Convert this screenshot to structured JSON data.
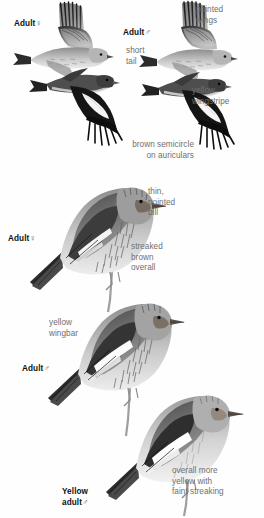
{
  "plate": {
    "species": "Pine Siskin",
    "background_color": "#ffffff",
    "label_color": "#111111",
    "annotation_color": "#6f6f6f"
  },
  "labels": {
    "flight_female": "Adult",
    "flight_female_sex": "♀",
    "flight_male": "Adult",
    "flight_male_sex": "♂",
    "perched_female": "Adult",
    "perched_female_sex": "♀",
    "perched_male": "Adult",
    "perched_male_sex": "♂",
    "yellow_adult": "Yellow\nadult",
    "yellow_adult_sex": "♂"
  },
  "annotations": {
    "pointed_wings": "pointed\nwings",
    "short_tail": "short\ntail",
    "yellow_wingstripe": "yellow\nwingstripe",
    "brown_semicircle": "brown semicircle\non auriculars",
    "thin_pointed_bill": "thin,\npointed\nbill",
    "streaked_brown": "streaked\nbrown\noverall",
    "yellow_wingbar": "yellow\nwingbar",
    "overall_more_yellow": "overall more\nyellow with\nfaint streaking"
  },
  "figures": [
    {
      "name": "flight-female-upper",
      "pose": "flight-upperside",
      "sex": "female"
    },
    {
      "name": "flight-female-lower",
      "pose": "flight-underside",
      "sex": "female"
    },
    {
      "name": "flight-male-upper",
      "pose": "flight-upperside",
      "sex": "male"
    },
    {
      "name": "flight-male-lower",
      "pose": "flight-underside",
      "sex": "male"
    },
    {
      "name": "perched-female",
      "pose": "perched",
      "sex": "female"
    },
    {
      "name": "perched-male",
      "pose": "perched",
      "sex": "male"
    },
    {
      "name": "perched-yellow-adult-male",
      "pose": "perched",
      "sex": "male"
    }
  ]
}
